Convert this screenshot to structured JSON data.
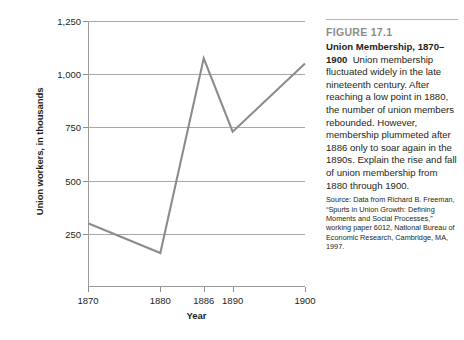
{
  "figure": {
    "number_label": "FIGURE 17.1",
    "title": "Union Membership,",
    "years_label": "1870–1900",
    "caption": "Union membership fluctuated widely in the late nineteenth century. After reaching a low point in 1880, the number of union members rebounded. However, membership plummeted after 1886 only to soar again in the 1890s. Explain the rise and fall of union membership from 1880 through 1900.",
    "source": "Source: Data from Richard B. Freeman, “Spurts in Union Growth: Defining Moments and Social Processes,” working paper 6012, National Bureau of Economic Research, Cambridge, MA, 1997."
  },
  "colors": {
    "line": "#8c8c8c",
    "gridline": "#a7a7a7",
    "axis": "#9a9a9a",
    "figure_number": "#8d8d8d",
    "text": "#231f20",
    "background": "#ffffff"
  },
  "chart_data": {
    "type": "line",
    "title": "Union Membership, 1870–1900",
    "xlabel": "Year",
    "ylabel": "Union workers, in thousands",
    "x": [
      1870,
      1880,
      1886,
      1890,
      1900
    ],
    "values": [
      300,
      160,
      1075,
      730,
      1050
    ],
    "series": [
      {
        "name": "Union workers",
        "values": [
          300,
          160,
          1075,
          730,
          1050
        ]
      }
    ],
    "xtick_labels": [
      "1870",
      "1880",
      "1886",
      "1890",
      "1900"
    ],
    "xticks": [
      1870,
      1880,
      1886,
      1890,
      1900
    ],
    "ytick_labels": [
      "250",
      "500",
      "750",
      "1,000",
      "1,250"
    ],
    "yticks": [
      250,
      500,
      750,
      1000,
      1250
    ],
    "xlim": [
      1870,
      1900
    ],
    "ylim": [
      0,
      1250
    ],
    "grid": true,
    "legend": false,
    "legend_position": "none"
  }
}
